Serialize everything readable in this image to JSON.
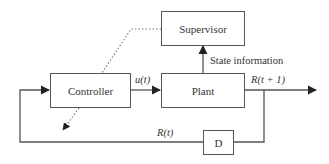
{
  "diagram": {
    "type": "block-diagram",
    "blocks": {
      "supervisor": "Supervisor",
      "controller": "Controller",
      "plant": "Plant",
      "delay": "D"
    },
    "labels": {
      "control_signal": "u(t)",
      "state_information": "State information",
      "output": "R(t + 1)",
      "feedback": "R(t)"
    },
    "edges": [
      {
        "from": "controller",
        "to": "plant",
        "label": "u(t)",
        "style": "solid"
      },
      {
        "from": "plant",
        "to": "supervisor",
        "label": "State information",
        "style": "solid"
      },
      {
        "from": "plant",
        "to": "output",
        "label": "R(t + 1)",
        "style": "solid"
      },
      {
        "from": "output",
        "to": "delay",
        "style": "solid"
      },
      {
        "from": "delay",
        "to": "controller",
        "label": "R(t)",
        "style": "solid"
      },
      {
        "from": "supervisor",
        "to": "controller",
        "style": "dotted",
        "note": "adjusts controller"
      }
    ],
    "colors": {
      "line": "#555555",
      "text": "#333333",
      "background": "#ffffff"
    }
  }
}
